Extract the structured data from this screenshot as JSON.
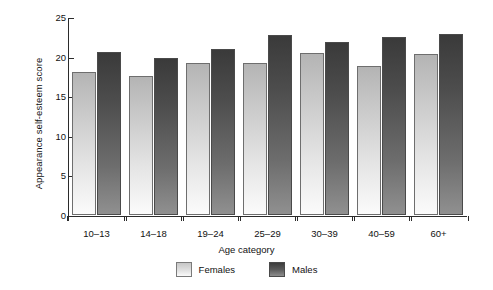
{
  "chart_data": {
    "type": "bar",
    "title": "",
    "xlabel": "Age category",
    "ylabel": "Appearance self-esteem score",
    "categories": [
      "10–13",
      "14–18",
      "19–24",
      "25–29",
      "30–39",
      "40–59",
      "60+"
    ],
    "series": [
      {
        "name": "Females",
        "values": [
          18.0,
          17.6,
          19.2,
          19.2,
          20.5,
          18.8,
          20.3
        ],
        "color": "#d8d8d8"
      },
      {
        "name": "Males",
        "values": [
          20.6,
          19.8,
          20.9,
          22.7,
          21.8,
          22.5,
          22.9
        ],
        "color": "#555555"
      }
    ],
    "ylim": [
      0,
      25
    ],
    "yticks": [
      0,
      5,
      10,
      15,
      20,
      25
    ],
    "ytick_labels": [
      "0",
      "5",
      "10",
      "15",
      "20",
      "25"
    ],
    "grid": false,
    "legend_position": "bottom"
  },
  "legend": {
    "entries": [
      {
        "label": "Females"
      },
      {
        "label": "Males"
      }
    ]
  }
}
